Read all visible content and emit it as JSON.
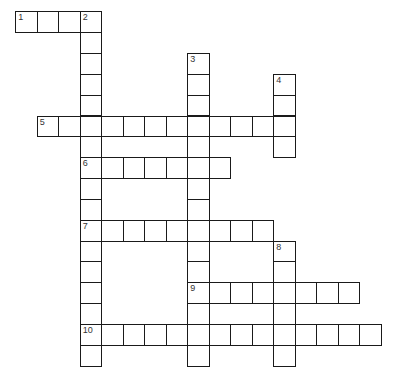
{
  "puzzle": {
    "cell_width": 21.5,
    "cell_height": 20.85,
    "origin_x": 16,
    "origin_y": 12,
    "line_color": "#1a1a1a",
    "entries": [
      {
        "number": "1",
        "direction": "across",
        "row": 0,
        "col": 0,
        "length": 4
      },
      {
        "number": "2",
        "direction": "down",
        "row": 0,
        "col": 3,
        "length": 17
      },
      {
        "number": "3",
        "direction": "down",
        "row": 2,
        "col": 8,
        "length": 15
      },
      {
        "number": "4",
        "direction": "down",
        "row": 3,
        "col": 12,
        "length": 4
      },
      {
        "number": "5",
        "direction": "across",
        "row": 5,
        "col": 1,
        "length": 12
      },
      {
        "number": "6",
        "direction": "across",
        "row": 7,
        "col": 3,
        "length": 7
      },
      {
        "number": "7",
        "direction": "across",
        "row": 10,
        "col": 3,
        "length": 9
      },
      {
        "number": "8",
        "direction": "down",
        "row": 11,
        "col": 12,
        "length": 6
      },
      {
        "number": "9",
        "direction": "across",
        "row": 13,
        "col": 8,
        "length": 8
      },
      {
        "number": "10",
        "direction": "across",
        "row": 15,
        "col": 3,
        "length": 14
      }
    ]
  }
}
